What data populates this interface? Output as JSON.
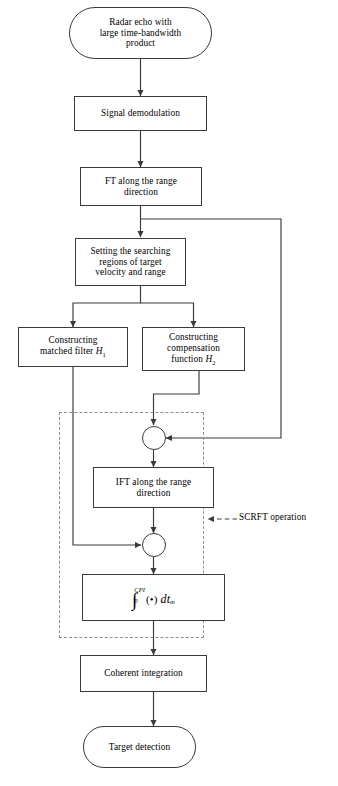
{
  "diagram": {
    "annotation": {
      "scrft_label": "SCRFT operation"
    },
    "nodes": {
      "start": {
        "label": "Radar echo with large time-bandwidth product",
        "line1": "Radar echo with",
        "line2": "large time-bandwidth",
        "line3": "product",
        "shape": "terminal"
      },
      "demod": {
        "label": "Signal demodulation",
        "shape": "process"
      },
      "ft": {
        "label": "FT along the range direction",
        "line1": "FT along the range",
        "line2": "direction",
        "shape": "process"
      },
      "setting": {
        "label": "Setting the searching regions of target velocity and range",
        "line1": "Setting the searching",
        "line2": "regions of target",
        "line3": "velocity and range",
        "shape": "process"
      },
      "matched": {
        "label": "Constructing matched filter H1",
        "line1": "Constructing",
        "line2_pre": "matched filter ",
        "line2_sym": "H",
        "line2_sub": "1",
        "shape": "process"
      },
      "compensation": {
        "label": "Constructing compensation function H2",
        "line1": "Constructing",
        "line2": "compensation",
        "line3_pre": "function ",
        "line3_sym": "H",
        "line3_sub": "2",
        "shape": "process"
      },
      "mult1": {
        "label": "multiply",
        "symbol": "cross-circle"
      },
      "ift": {
        "label": "IFT along the range direction",
        "line1": "IFT along the range",
        "line2": "direction",
        "shape": "process"
      },
      "mult2": {
        "label": "multiply",
        "symbol": "cross-circle"
      },
      "integral": {
        "label": "Integral from 0 to CPI of dot dt_m",
        "upper_limit": "CPI",
        "lower_limit": "0",
        "integrand": "(•)",
        "differential_pre": "dt",
        "differential_sub": "m",
        "shape": "process"
      },
      "coherent": {
        "label": "Coherent integration",
        "shape": "process"
      },
      "detection": {
        "label": "Target detection",
        "shape": "terminal"
      }
    },
    "colors": {
      "stroke": "#3a3a3a",
      "dashed": "#8d8d8d",
      "background": "#ffffff",
      "text": "#000000"
    }
  }
}
